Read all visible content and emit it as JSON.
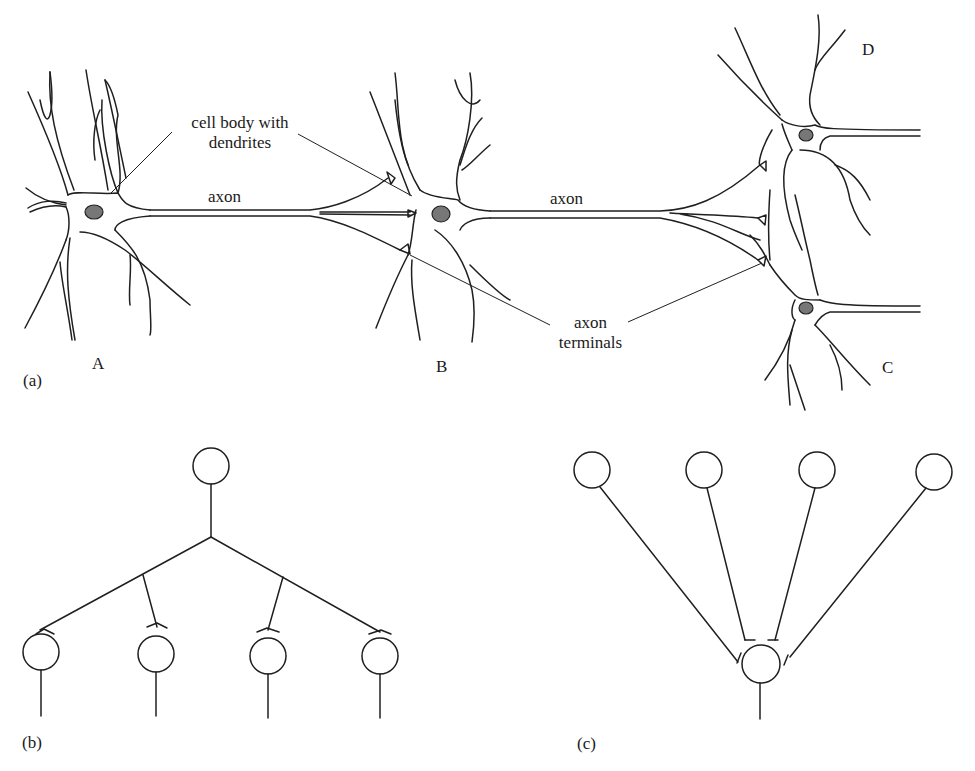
{
  "figure": {
    "panel_a": {
      "label": "(a)",
      "neurons": [
        {
          "id": "A",
          "label": "A"
        },
        {
          "id": "B",
          "label": "B"
        },
        {
          "id": "C",
          "label": "C"
        },
        {
          "id": "D",
          "label": "D"
        }
      ],
      "annotations": {
        "cell_body_line1": "cell body with",
        "cell_body_line2": "dendrites",
        "axon_1": "axon",
        "axon_2": "axon",
        "terminals_line1": "axon",
        "terminals_line2": "terminals"
      },
      "connections": [
        {
          "from": "A",
          "to": "B"
        },
        {
          "from": "B",
          "to": "D"
        },
        {
          "from": "B",
          "to": "C"
        }
      ]
    },
    "panel_b": {
      "label": "(b)",
      "description": "divergence: one neuron branching to four neurons",
      "top_nodes": 1,
      "bottom_nodes": 4
    },
    "panel_c": {
      "label": "(c)",
      "description": "convergence: four neurons converging onto one neuron",
      "top_nodes": 4,
      "bottom_nodes": 1
    }
  }
}
